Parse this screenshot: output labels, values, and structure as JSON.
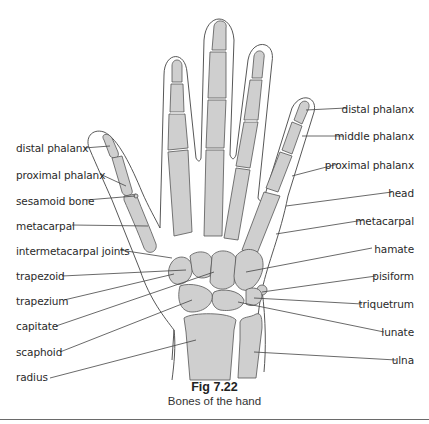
{
  "figure": {
    "number": "Fig 7.22",
    "caption": "Bones of the hand",
    "colors": {
      "bone_fill": "#cfcfcf",
      "bone_stroke": "#555555",
      "skin_stroke": "#444444",
      "leader": "#444444",
      "text": "#2a2a2a"
    }
  },
  "labels": {
    "left": [
      {
        "text": "distal phalanx",
        "x": 16,
        "y": 142
      },
      {
        "text": "proximal phalanx",
        "x": 16,
        "y": 169
      },
      {
        "text": "sesamoid bone",
        "x": 16,
        "y": 195
      },
      {
        "text": "metacarpal",
        "x": 16,
        "y": 220
      },
      {
        "text": "intermetacarpal joints",
        "x": 16,
        "y": 245
      },
      {
        "text": "trapezoid",
        "x": 16,
        "y": 270
      },
      {
        "text": "trapezium",
        "x": 16,
        "y": 295
      },
      {
        "text": "capitate",
        "x": 16,
        "y": 320
      },
      {
        "text": "scaphoid",
        "x": 16,
        "y": 346
      },
      {
        "text": "radius",
        "x": 16,
        "y": 371
      }
    ],
    "right": [
      {
        "text": "distal phalanx",
        "x": 414,
        "y": 103
      },
      {
        "text": "middle phalanx",
        "x": 414,
        "y": 130
      },
      {
        "text": "proximal phalanx",
        "x": 414,
        "y": 159
      },
      {
        "text": "head",
        "x": 414,
        "y": 187
      },
      {
        "text": "metacarpal",
        "x": 414,
        "y": 215
      },
      {
        "text": "hamate",
        "x": 414,
        "y": 243
      },
      {
        "text": "pisiform",
        "x": 414,
        "y": 270
      },
      {
        "text": "triquetrum",
        "x": 414,
        "y": 298
      },
      {
        "text": "lunate",
        "x": 414,
        "y": 326
      },
      {
        "text": "ulna",
        "x": 414,
        "y": 354
      }
    ]
  }
}
